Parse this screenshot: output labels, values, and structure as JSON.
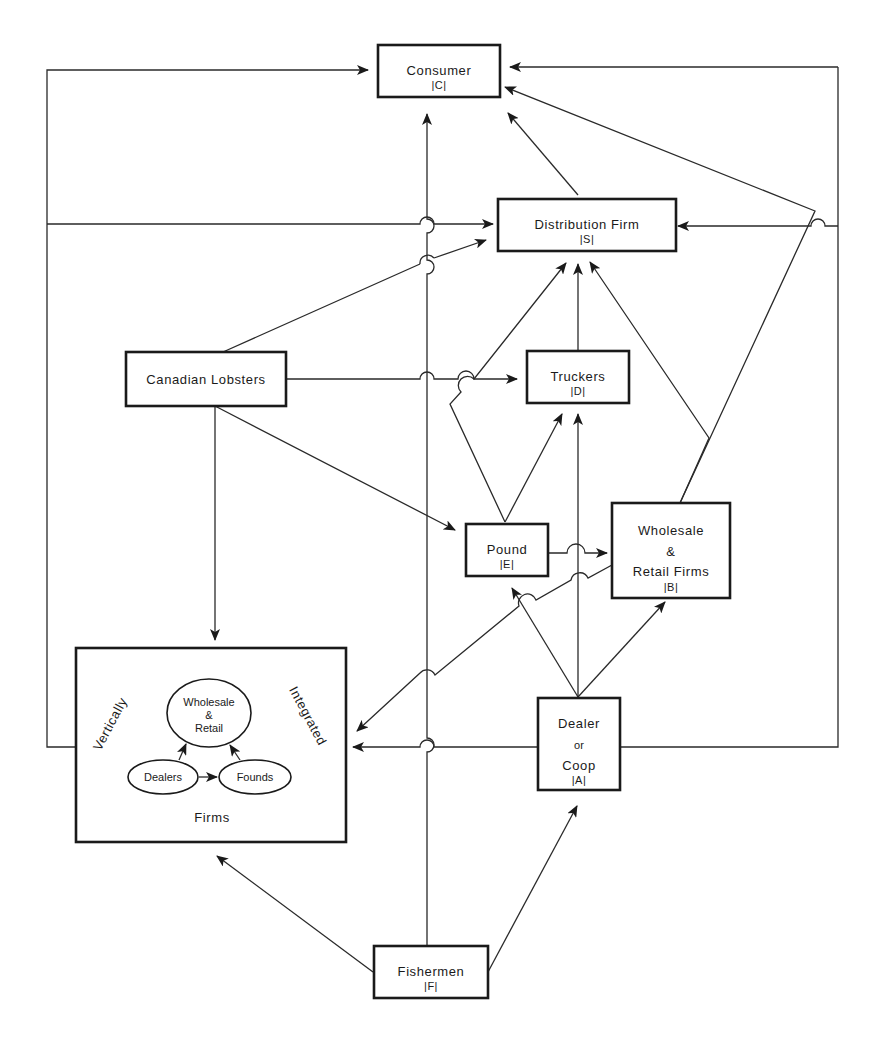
{
  "diagram": {
    "nodes": {
      "consumer": {
        "label": "Consumer",
        "code": "|C|"
      },
      "distribution": {
        "label": "Distribution  Firm",
        "code": "|S|"
      },
      "canadian": {
        "label": "Canadian  Lobsters"
      },
      "truckers": {
        "label": "Truckers",
        "code": "|D|"
      },
      "pound": {
        "label": "Pound",
        "code": "|E|"
      },
      "wholesale": {
        "line1": "Wholesale",
        "line2": "&",
        "line3": "Retail  Firms",
        "code": "|B|"
      },
      "dealer": {
        "line1": "Dealer",
        "line2": "or",
        "line3": "Coop",
        "code": "|A|"
      },
      "fishermen": {
        "label": "Fishermen",
        "code": "|F|"
      },
      "vertical": {
        "word_left": "Vertically",
        "word_right": "Integrated",
        "word_bottom": "Firms",
        "inner_wholesale": {
          "line1": "Wholesale",
          "line2": "&",
          "line3": "Retail"
        },
        "inner_dealers": "Dealers",
        "inner_pounds": "Founds"
      }
    },
    "edges": [
      {
        "from": "Fishermen",
        "to": "Consumer"
      },
      {
        "from": "Fishermen",
        "to": "Vertically Integrated Firms"
      },
      {
        "from": "Fishermen",
        "to": "Dealer or Coop"
      },
      {
        "from": "Vertically Integrated Firms",
        "to": "Consumer"
      },
      {
        "from": "Vertically Integrated Firms",
        "to": "Distribution Firm"
      },
      {
        "from": "Canadian Lobsters",
        "to": "Distribution Firm"
      },
      {
        "from": "Canadian Lobsters",
        "to": "Truckers"
      },
      {
        "from": "Canadian Lobsters",
        "to": "Pound"
      },
      {
        "from": "Canadian Lobsters",
        "to": "Vertically Integrated Firms"
      },
      {
        "from": "Distribution Firm",
        "to": "Consumer"
      },
      {
        "from": "Truckers",
        "to": "Distribution Firm"
      },
      {
        "from": "Pound",
        "to": "Distribution Firm"
      },
      {
        "from": "Pound",
        "to": "Truckers"
      },
      {
        "from": "Pound",
        "to": "Wholesale & Retail Firms"
      },
      {
        "from": "Wholesale & Retail Firms",
        "to": "Distribution Firm"
      },
      {
        "from": "Wholesale & Retail Firms",
        "to": "Consumer"
      },
      {
        "from": "Wholesale & Retail Firms",
        "to": "Vertically Integrated Firms"
      },
      {
        "from": "Dealer or Coop",
        "to": "Pound"
      },
      {
        "from": "Dealer or Coop",
        "to": "Truckers"
      },
      {
        "from": "Dealer or Coop",
        "to": "Wholesale & Retail Firms"
      },
      {
        "from": "Dealer or Coop",
        "to": "Vertically Integrated Firms"
      },
      {
        "from": "Dealer or Coop",
        "to": "Consumer"
      },
      {
        "from": "Dealer or Coop",
        "to": "Distribution Firm"
      },
      {
        "from": "Dealers",
        "to": "Founds"
      },
      {
        "from": "Dealers",
        "to": "Wholesale & Retail"
      },
      {
        "from": "Founds",
        "to": "Wholesale & Retail"
      }
    ]
  }
}
